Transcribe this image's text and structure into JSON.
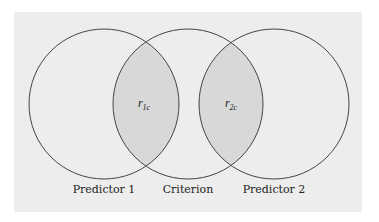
{
  "diagram": {
    "type": "venn",
    "colors": {
      "background": "#ffffff",
      "panel": "#ededed",
      "overlap_fill": "#d8d8d8",
      "stroke": "#444444"
    },
    "circles": [
      {
        "id": "predictor-1",
        "label": "Predictor 1",
        "cx": 104,
        "cy": 104,
        "r": 75
      },
      {
        "id": "criterion",
        "label": "Criterion",
        "cx": 188,
        "cy": 104,
        "r": 75
      },
      {
        "id": "predictor-2",
        "label": "Predictor 2",
        "cx": 274,
        "cy": 104,
        "r": 75
      }
    ],
    "overlaps": [
      {
        "id": "r1c",
        "symbol": "r",
        "subscript": "1c",
        "between": [
          "predictor-1",
          "criterion"
        ]
      },
      {
        "id": "r2c",
        "symbol": "r",
        "subscript": "2c",
        "between": [
          "criterion",
          "predictor-2"
        ]
      }
    ]
  }
}
